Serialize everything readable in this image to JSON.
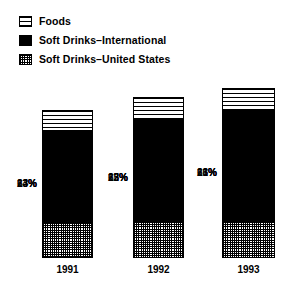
{
  "legend": {
    "position": "top-left",
    "items": [
      {
        "label": "Foods",
        "swatch": "horizontal-stripes-swatch",
        "pattern": "horizontal-lines",
        "color": "#ffffff"
      },
      {
        "label": "Soft Drinks–International",
        "swatch": "solid-black-swatch",
        "pattern": "solid",
        "color": "#000000"
      },
      {
        "label": "Soft Drinks–United States",
        "swatch": "crosshatch-swatch",
        "pattern": "crosshatch",
        "color": "#808080"
      }
    ]
  },
  "bars": [
    {
      "category": "1991",
      "total_height_px": 148,
      "segments": [
        {
          "series": "Foods",
          "label": "14%",
          "value": 14
        },
        {
          "series": "Soft Drinks–International",
          "label": "63%",
          "value": 63
        },
        {
          "series": "Soft Drinks–United States",
          "label": "23%",
          "value": 23
        }
      ]
    },
    {
      "category": "1992",
      "total_height_px": 161,
      "segments": [
        {
          "series": "Foods",
          "label": "13%",
          "value": 13
        },
        {
          "series": "Soft Drinks–International",
          "label": "65%",
          "value": 65
        },
        {
          "series": "Soft Drinks–United States",
          "label": "22%",
          "value": 22
        }
      ]
    },
    {
      "category": "1993",
      "total_height_px": 170,
      "segments": [
        {
          "series": "Foods",
          "label": "13%",
          "value": 13
        },
        {
          "series": "Soft Drinks–International",
          "label": "66%",
          "value": 66
        },
        {
          "series": "Soft Drinks–United States",
          "label": "21%",
          "value": 21
        }
      ]
    }
  ],
  "chart_data": {
    "type": "bar",
    "subtype": "stacked-100-percent",
    "title": "",
    "subtitle": "",
    "xlabel": "",
    "ylabel": "",
    "categories": [
      "1991",
      "1992",
      "1993"
    ],
    "series": [
      {
        "name": "Soft Drinks–United States",
        "values": [
          23,
          22,
          21
        ],
        "pattern": "crosshatch",
        "stack_order": "bottom"
      },
      {
        "name": "Soft Drinks–International",
        "values": [
          63,
          65,
          66
        ],
        "pattern": "solid",
        "color": "#000000",
        "stack_order": "middle"
      },
      {
        "name": "Foods",
        "values": [
          14,
          13,
          13
        ],
        "pattern": "horizontal-lines",
        "color": "#ffffff",
        "stack_order": "top"
      }
    ],
    "data_labels": [
      [
        "23%",
        "63%",
        "14%"
      ],
      [
        "22%",
        "65%",
        "13%"
      ],
      [
        "21%",
        "66%",
        "13%"
      ]
    ],
    "ylim": [
      0,
      100
    ],
    "grid": false,
    "legend_position": "top-left",
    "units": "percent"
  }
}
